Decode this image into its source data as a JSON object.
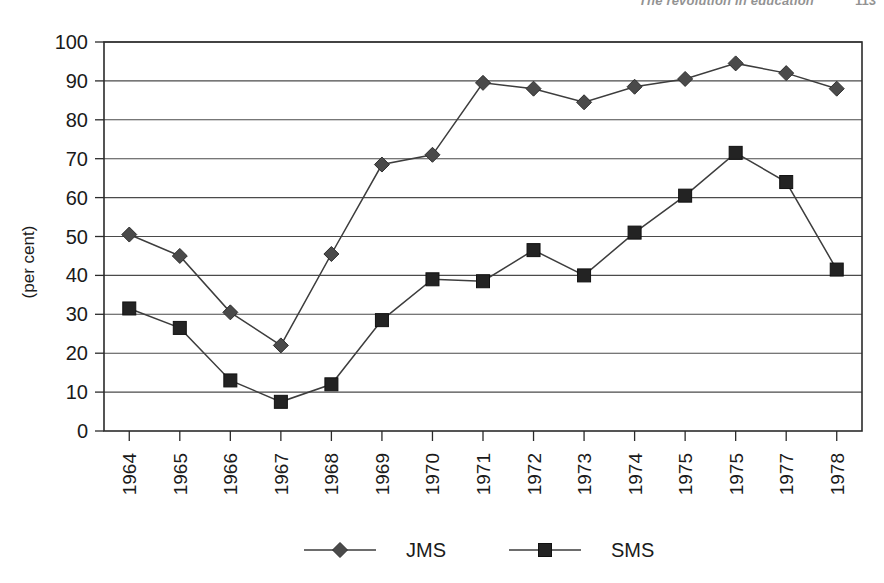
{
  "running_head": {
    "title": "The revolution in education",
    "page": "113"
  },
  "chart_data": {
    "type": "line",
    "title": "",
    "xlabel": "",
    "ylabel": "(per cent)",
    "ylim": [
      0,
      100
    ],
    "ytick_step": 10,
    "yticks": [
      "0",
      "10",
      "20",
      "30",
      "40",
      "50",
      "60",
      "70",
      "80",
      "90",
      "100"
    ],
    "grid": "horizontal",
    "legend_position": "bottom",
    "categories": [
      "1964",
      "1965",
      "1966",
      "1967",
      "1968",
      "1969",
      "1970",
      "1971",
      "1972",
      "1973",
      "1974",
      "1975",
      "1975",
      "1977",
      "1978"
    ],
    "series": [
      {
        "name": "JMS",
        "marker": "diamond",
        "color": "#4a4a4a",
        "values": [
          50.5,
          45,
          30.5,
          22,
          45.5,
          68.5,
          71,
          89.5,
          88,
          84.5,
          88.5,
          90.5,
          94.5,
          92,
          88
        ]
      },
      {
        "name": "SMS",
        "marker": "square",
        "color": "#232323",
        "values": [
          31.5,
          26.5,
          13,
          7.5,
          12,
          28.5,
          39,
          38.5,
          46.5,
          40,
          51,
          60.5,
          71.5,
          64,
          41.5
        ]
      }
    ]
  },
  "legend": {
    "items": [
      {
        "label": "JMS",
        "marker": "diamond"
      },
      {
        "label": "SMS",
        "marker": "square"
      }
    ]
  }
}
